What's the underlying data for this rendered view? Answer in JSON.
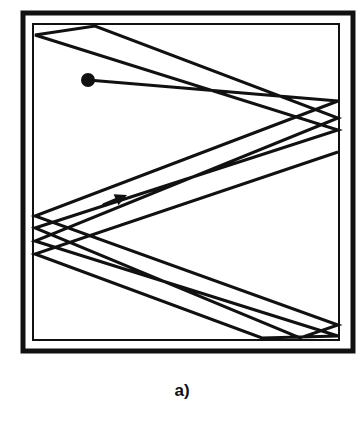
{
  "figure": {
    "caption": "a)",
    "colors": {
      "ink": "#111111",
      "background": "#ffffff"
    },
    "outer_frame": {
      "x": 23,
      "y": 13,
      "w": 330,
      "h": 338,
      "stroke": 5
    },
    "inner_frame": {
      "x": 33,
      "y": 24,
      "w": 306,
      "h": 316,
      "stroke": 2
    },
    "start_dot": {
      "cx": 88,
      "cy": 80,
      "r": 7
    },
    "trajectory_points": [
      [
        88,
        80
      ],
      [
        338,
        101
      ],
      [
        35,
        216
      ],
      [
        338,
        325
      ],
      [
        300,
        338
      ],
      [
        35,
        228
      ],
      [
        338,
        130
      ],
      [
        35,
        35
      ],
      [
        95,
        26
      ],
      [
        338,
        118
      ],
      [
        35,
        241
      ],
      [
        338,
        336
      ],
      [
        262,
        338
      ],
      [
        35,
        254
      ],
      [
        338,
        152
      ]
    ],
    "arrow": {
      "x1": 104,
      "y1": 205,
      "x2": 127,
      "y2": 195
    }
  }
}
